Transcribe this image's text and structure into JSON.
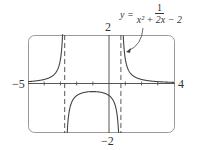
{
  "chart_data": {
    "type": "line",
    "title": "",
    "equation": {
      "lhs": "y =",
      "numerator": "1",
      "denominator": "x² + 2x − 2"
    },
    "xlabel": "",
    "ylabel": "",
    "xlim": [
      -5,
      4
    ],
    "ylim": [
      -2,
      2
    ],
    "tick_labels": {
      "x_min": "−5",
      "x_max": "4",
      "y_max": "2",
      "y_min": "−2"
    },
    "x_ticks": [
      -4,
      -3,
      -2,
      -1,
      1,
      2,
      3
    ],
    "vertical_asymptotes": [
      -2.732,
      0.732
    ],
    "series": [
      {
        "name": "y = 1/(x^2+2x-2)",
        "function": "1/(x^2+2x-2)",
        "sample_points": [
          [
            -5,
            0.077
          ],
          [
            -4,
            0.167
          ],
          [
            -3.5,
            0.267
          ],
          [
            -3,
            1.0
          ],
          [
            -2.9,
            1.69
          ],
          [
            -2.5,
            -0.8
          ],
          [
            -2,
            -0.5
          ],
          [
            -1,
            -0.333
          ],
          [
            0,
            -0.5
          ],
          [
            0.5,
            -1.333
          ],
          [
            0.65,
            -4.5
          ],
          [
            0.8,
            4.17
          ],
          [
            1,
            1.0
          ],
          [
            2,
            0.167
          ],
          [
            3,
            0.077
          ],
          [
            4,
            0.045
          ]
        ]
      }
    ],
    "grid": false,
    "colors": {
      "curve": "#444444",
      "asymptote": "#444444",
      "frame": "#888888"
    }
  }
}
